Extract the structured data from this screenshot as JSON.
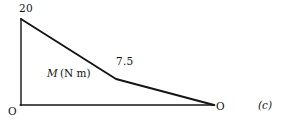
{
  "figure": {
    "part_caption": "(c)",
    "quantity_symbol": "M",
    "quantity_unit": "(N m)",
    "origin_left_label": "O",
    "origin_right_label": "O",
    "peak_label": "20",
    "kink_label": "7.5",
    "line_color": "#141414",
    "background_color": "#ffffff"
  },
  "chart_data": {
    "type": "line",
    "title": "",
    "subtitle": "",
    "xlabel": "",
    "ylabel": "M (N m)",
    "annotations": [
      "20",
      "7.5",
      "M (N m)",
      "O",
      "O",
      "(c)"
    ],
    "grid": false,
    "legend_position": "none",
    "axis_style": "two-line corner axes (vertical left, horizontal base)",
    "xlim": [
      0,
      1
    ],
    "ylim": [
      0,
      20
    ],
    "x": [
      0,
      0.49,
      1.0
    ],
    "values": [
      20,
      7.5,
      0
    ],
    "series": [
      {
        "name": "Bending moment M",
        "x": [
          0,
          0.49,
          1.0
        ],
        "values": [
          20,
          7.5,
          0
        ],
        "point_labels": [
          "20",
          "7.5",
          ""
        ]
      }
    ],
    "vertices_px": [
      [
        21,
        19
      ],
      [
        116,
        79
      ],
      [
        214,
        105
      ]
    ],
    "axis_vertical_px": [
      [
        21,
        19
      ],
      [
        21,
        105
      ]
    ],
    "axis_horizontal_px": [
      [
        21,
        105
      ],
      [
        214,
        105
      ]
    ]
  }
}
